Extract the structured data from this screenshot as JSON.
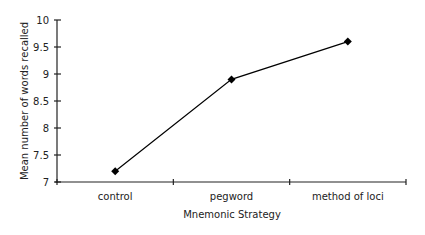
{
  "chart_data": {
    "type": "line",
    "title": "",
    "xlabel": "Mnemonic Strategy",
    "ylabel": "Mean number of words recalled",
    "categories": [
      "control",
      "pegword",
      "method of loci"
    ],
    "series": [
      {
        "name": "Mean words recalled",
        "values": [
          7.2,
          8.9,
          9.6
        ],
        "marker": "diamond",
        "color": "#000000"
      }
    ],
    "ylim": [
      7,
      10
    ],
    "yticks": [
      7,
      7.5,
      8,
      8.5,
      9,
      9.5,
      10
    ],
    "ytick_labels": [
      "7",
      "7.5",
      "8",
      "8.5",
      "9",
      "9.5",
      "10"
    ],
    "grid": false,
    "legend": null
  }
}
